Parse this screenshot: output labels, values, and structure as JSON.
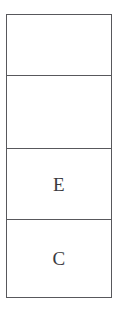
{
  "document": {
    "kind": "table-fragment",
    "background_color": "#ffffff",
    "border_color": "#58585c",
    "text_color": "#3a3a3e"
  },
  "table": {
    "columns": 1,
    "rows": [
      {
        "name": "row-1",
        "value": ""
      },
      {
        "name": "row-2",
        "value": ""
      },
      {
        "name": "row-3",
        "value": "E"
      },
      {
        "name": "row-4",
        "value": "C"
      }
    ]
  }
}
